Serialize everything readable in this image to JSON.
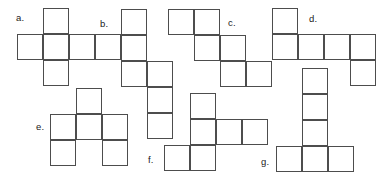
{
  "figure": {
    "width": 385,
    "height": 178,
    "background_color": "#ffffff",
    "line_color": "#4d4d4d",
    "label_color": "#1a1a1a",
    "cell_size": 26
  },
  "nets": [
    {
      "id": "net-a",
      "label": "a.",
      "label_x": 16,
      "label_y": 13,
      "origin_x": 17,
      "origin_y": 8,
      "cols": 4,
      "rows": 3,
      "cells": [
        {
          "row": 0,
          "col": 1
        },
        {
          "row": 1,
          "col": 0
        },
        {
          "row": 1,
          "col": 1
        },
        {
          "row": 1,
          "col": 2
        },
        {
          "row": 1,
          "col": 3
        },
        {
          "row": 2,
          "col": 1
        }
      ]
    },
    {
      "id": "net-b",
      "label": "b.",
      "label_x": 100,
      "label_y": 19,
      "origin_x": 121,
      "origin_y": 9,
      "cols": 2,
      "rows": 5,
      "cells": [
        {
          "row": 0,
          "col": 0
        },
        {
          "row": 1,
          "col": 0
        },
        {
          "row": 2,
          "col": 0
        },
        {
          "row": 2,
          "col": 1
        },
        {
          "row": 3,
          "col": 1
        },
        {
          "row": 4,
          "col": 1
        }
      ]
    },
    {
      "id": "net-c",
      "label": "c.",
      "label_x": 228,
      "label_y": 18,
      "origin_x": 168,
      "origin_y": 9,
      "cols": 4,
      "rows": 3,
      "cells": [
        {
          "row": 0,
          "col": 0
        },
        {
          "row": 0,
          "col": 1
        },
        {
          "row": 1,
          "col": 1
        },
        {
          "row": 1,
          "col": 2
        },
        {
          "row": 2,
          "col": 2
        },
        {
          "row": 2,
          "col": 3
        }
      ]
    },
    {
      "id": "net-d",
      "label": "d.",
      "label_x": 309,
      "label_y": 14,
      "origin_x": 272,
      "origin_y": 8,
      "cols": 4,
      "rows": 3,
      "cells": [
        {
          "row": 0,
          "col": 0
        },
        {
          "row": 1,
          "col": 0
        },
        {
          "row": 1,
          "col": 1
        },
        {
          "row": 1,
          "col": 2
        },
        {
          "row": 1,
          "col": 3
        },
        {
          "row": 2,
          "col": 3
        }
      ]
    },
    {
      "id": "net-e",
      "label": "e.",
      "label_x": 36,
      "label_y": 122,
      "origin_x": 50,
      "origin_y": 88,
      "cols": 3,
      "rows": 3,
      "cells": [
        {
          "row": 0,
          "col": 1
        },
        {
          "row": 1,
          "col": 0
        },
        {
          "row": 1,
          "col": 1
        },
        {
          "row": 1,
          "col": 2
        },
        {
          "row": 2,
          "col": 0
        },
        {
          "row": 2,
          "col": 2
        }
      ]
    },
    {
      "id": "net-f",
      "label": "f.",
      "label_x": 148,
      "label_y": 155,
      "origin_x": 164,
      "origin_y": 93,
      "cols": 4,
      "rows": 3,
      "cells": [
        {
          "row": 0,
          "col": 1
        },
        {
          "row": 1,
          "col": 1
        },
        {
          "row": 1,
          "col": 2
        },
        {
          "row": 1,
          "col": 3
        },
        {
          "row": 2,
          "col": 0
        },
        {
          "row": 2,
          "col": 1
        }
      ]
    },
    {
      "id": "net-g",
      "label": "g.",
      "label_x": 261,
      "label_y": 157,
      "origin_x": 276,
      "origin_y": 68,
      "cols": 3,
      "rows": 4,
      "cells": [
        {
          "row": 0,
          "col": 1
        },
        {
          "row": 1,
          "col": 1
        },
        {
          "row": 2,
          "col": 1
        },
        {
          "row": 3,
          "col": 0
        },
        {
          "row": 3,
          "col": 1
        },
        {
          "row": 3,
          "col": 2
        }
      ]
    }
  ]
}
